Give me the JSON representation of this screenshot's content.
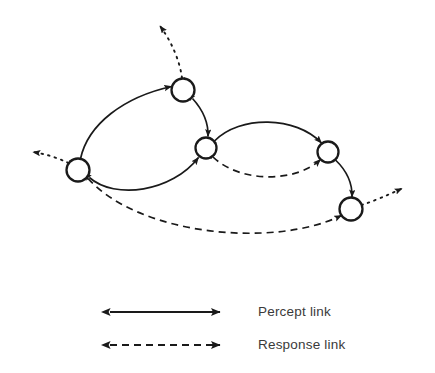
{
  "figure": {
    "title": "",
    "background_color": "#ffffff",
    "stroke_color": "#1a1a1a",
    "node_fill": "#ffffff",
    "text_color": "#3a3a3a",
    "width": 435,
    "height": 373
  },
  "diagram": {
    "type": "node-link-graph",
    "node_label": "node",
    "nodes": [
      {
        "id": "left",
        "name": "node-left",
        "cx": 78,
        "cy": 170,
        "r": 11.5
      },
      {
        "id": "top",
        "name": "node-top",
        "cx": 183,
        "cy": 90,
        "r": 11.5
      },
      {
        "id": "center",
        "name": "node-center",
        "cx": 206,
        "cy": 148,
        "r": 10.5
      },
      {
        "id": "upper-right",
        "name": "node-upper-right",
        "cx": 328,
        "cy": 152,
        "r": 10.5
      },
      {
        "id": "lower-right",
        "name": "node-lower-right",
        "cx": 351,
        "cy": 209,
        "r": 11.5
      }
    ],
    "links": [
      {
        "id": "left-top",
        "name": "percept-link-left-top",
        "kind": "percept",
        "style": "solid",
        "from": "left",
        "to": "top",
        "arrows": "both"
      },
      {
        "id": "left-center",
        "name": "percept-link-left-center",
        "kind": "percept",
        "style": "solid",
        "from": "left",
        "to": "center",
        "arrows": "both"
      },
      {
        "id": "top-center",
        "name": "percept-link-top-center",
        "kind": "percept",
        "style": "solid",
        "from": "top",
        "to": "center",
        "arrows": "both"
      },
      {
        "id": "center-upperright",
        "name": "percept-link-center-upper-right",
        "kind": "percept",
        "style": "solid",
        "from": "center",
        "to": "upper-right",
        "arrows": "both"
      },
      {
        "id": "upperright-lowerright",
        "name": "percept-link-upper-right-lower-right",
        "kind": "percept",
        "style": "solid",
        "from": "upper-right",
        "to": "lower-right",
        "arrows": "both"
      },
      {
        "id": "center-upperright-d",
        "name": "response-link-center-upper-right",
        "kind": "response",
        "style": "dashed",
        "from": "center",
        "to": "upper-right",
        "arrows": "both"
      },
      {
        "id": "left-lowerright-d",
        "name": "response-link-left-lower-right",
        "kind": "response",
        "style": "dashed",
        "from": "left",
        "to": "lower-right",
        "arrows": "both"
      }
    ],
    "external_links": [
      {
        "id": "ext-top",
        "name": "response-link-external-top",
        "kind": "response",
        "style": "dotted",
        "from": "top",
        "direction": "up-left",
        "arrows": "both"
      },
      {
        "id": "ext-left",
        "name": "response-link-external-left",
        "kind": "response",
        "style": "dotted",
        "from": "left",
        "direction": "left",
        "arrows": "both"
      },
      {
        "id": "ext-right",
        "name": "response-link-external-right",
        "kind": "response",
        "style": "dotted",
        "from": "lower-right",
        "direction": "right-up",
        "arrows": "both"
      }
    ]
  },
  "legend": {
    "items": [
      {
        "id": "percept",
        "label": "Percept link",
        "style": "solid",
        "arrows": "both"
      },
      {
        "id": "response",
        "label": "Response link",
        "style": "dashed",
        "arrows": "both"
      }
    ],
    "percept_label": "Percept link",
    "response_label": "Response link"
  }
}
